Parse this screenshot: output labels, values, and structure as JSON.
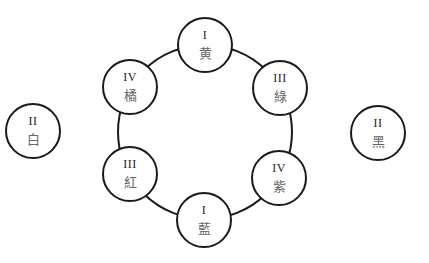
{
  "diagram": {
    "type": "color-wheel",
    "ring": {
      "cx": 205,
      "cy": 132,
      "r": 87,
      "stroke": "#1a1a1a"
    },
    "nodes": [
      {
        "id": "yellow",
        "numeral": "I",
        "char": "黄",
        "cx": 205,
        "cy": 45
      },
      {
        "id": "green",
        "numeral": "III",
        "char": "綠",
        "cx": 280,
        "cy": 88
      },
      {
        "id": "purple",
        "numeral": "IV",
        "char": "紫",
        "cx": 279,
        "cy": 178
      },
      {
        "id": "blue",
        "numeral": "I",
        "char": "藍",
        "cx": 204,
        "cy": 220
      },
      {
        "id": "red",
        "numeral": "III",
        "char": "紅",
        "cx": 130,
        "cy": 174
      },
      {
        "id": "orange",
        "numeral": "IV",
        "char": "橘",
        "cx": 130,
        "cy": 87
      }
    ],
    "outer_nodes": [
      {
        "id": "white",
        "numeral": "II",
        "char": "白",
        "cx": 33,
        "cy": 131
      },
      {
        "id": "black",
        "numeral": "II",
        "char": "黑",
        "cx": 378,
        "cy": 133
      }
    ]
  }
}
